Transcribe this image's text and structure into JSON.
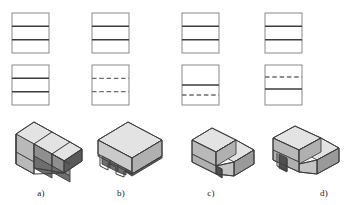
{
  "figure": {
    "type": "engineering-graphics-multiview-problem",
    "background_color": "#ffffff",
    "width": 359,
    "height": 205,
    "line_color_object": "#3d3d3d",
    "line_color_outline": "#8a8a8a",
    "line_color_hidden": "#6b6b6b",
    "label_color": "#1a1a1a"
  },
  "style": {
    "face_top_color": "#e3e3e3",
    "face_left_color": "#b9b9b9",
    "face_right_color": "#9a9a9a",
    "face_dark_color": "#6e6e6e",
    "face_darkest_color": "#4f4f4f",
    "edge_color": "#3d3d3d"
  },
  "columns": [
    {
      "id": "a",
      "label": "a)",
      "top_view": {
        "name": "top-view",
        "outline": "rectangle",
        "internal_lines": [
          {
            "position": 0.3333,
            "style": "solid"
          },
          {
            "position": 0.6667,
            "style": "solid"
          }
        ]
      },
      "front_view": {
        "name": "front-view",
        "outline": "rectangle",
        "internal_lines": [
          {
            "position": 0.3333,
            "style": "solid"
          },
          {
            "position": 0.6667,
            "style": "solid"
          }
        ]
      },
      "isometric": {
        "name": "isometric-three-step-staircase",
        "description": "three-step staircase rising to the left rear"
      }
    },
    {
      "id": "b",
      "label": "b)",
      "top_view": {
        "name": "top-view",
        "outline": "rectangle",
        "internal_lines": [
          {
            "position": 0.3333,
            "style": "solid"
          },
          {
            "position": 0.6667,
            "style": "solid"
          }
        ]
      },
      "front_view": {
        "name": "front-view",
        "outline": "rectangle",
        "internal_lines": [
          {
            "position": 0.3333,
            "style": "hidden"
          },
          {
            "position": 0.6667,
            "style": "hidden"
          }
        ]
      },
      "isometric": {
        "name": "isometric-block-with-stepped-undercut",
        "description": "rectangular block with stepped notches cut into the underside"
      }
    },
    {
      "id": "c",
      "label": "c)",
      "top_view": {
        "name": "top-view",
        "outline": "rectangle",
        "internal_lines": [
          {
            "position": 0.3333,
            "style": "solid"
          },
          {
            "position": 0.6667,
            "style": "solid"
          }
        ]
      },
      "front_view": {
        "name": "front-view",
        "outline": "rectangle",
        "internal_lines": [
          {
            "position": 0.5,
            "style": "solid"
          },
          {
            "position": 0.75,
            "style": "hidden"
          }
        ]
      },
      "isometric": {
        "name": "isometric-two-step-block",
        "description": "two-level stepped block with raised rear portion"
      }
    },
    {
      "id": "d",
      "label": "d)",
      "top_view": {
        "name": "top-view",
        "outline": "rectangle",
        "internal_lines": [
          {
            "position": 0.3333,
            "style": "solid"
          },
          {
            "position": 0.6667,
            "style": "solid"
          }
        ]
      },
      "front_view": {
        "name": "front-view",
        "outline": "rectangle",
        "internal_lines": [
          {
            "position": 0.3,
            "style": "hidden"
          },
          {
            "position": 0.6,
            "style": "solid"
          }
        ]
      },
      "isometric": {
        "name": "isometric-two-step-block-with-notch",
        "description": "two-level stepped block with a notch at the lower left front"
      }
    }
  ]
}
